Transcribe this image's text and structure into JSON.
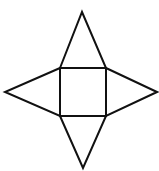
{
  "diagram": {
    "stroke_color": "#111111",
    "background_color": "#ffffff",
    "base_square": {
      "x1": 60,
      "y1": 68,
      "x2": 106,
      "y2": 116
    },
    "triangles": [
      {
        "name": "top",
        "points": "60,68 82,12 106,68"
      },
      {
        "name": "right",
        "points": "106,68 157,92 106,116"
      },
      {
        "name": "bottom",
        "points": "60,116 83,168 106,116"
      },
      {
        "name": "left",
        "points": "60,68 5,92 60,116"
      }
    ]
  }
}
